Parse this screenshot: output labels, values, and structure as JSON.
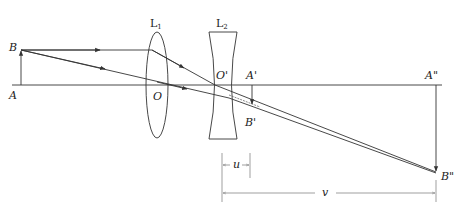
{
  "diagram": {
    "labels": {
      "object_top": "B",
      "object_base": "A",
      "lens1": "L",
      "lens1_sub": "1",
      "lens2": "L",
      "lens2_sub": "2",
      "lens1_center": "O",
      "lens2_center": "O'",
      "intermediate_image_base": "A'",
      "intermediate_image_top": "B'",
      "final_image_base": "A\"",
      "final_image_top": "B\"",
      "dimension_u": "u",
      "dimension_v": "v"
    },
    "colors": {
      "line": "#333333",
      "background": "#ffffff",
      "dimension": "#777777"
    }
  }
}
